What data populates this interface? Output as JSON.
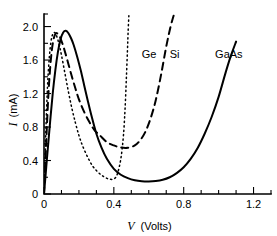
{
  "chart_data": {
    "type": "line",
    "title": "",
    "xlabel": "V  (Volts)",
    "ylabel": "I  (mA)",
    "xlabel_symbol": "V",
    "xlabel_unit": "(Volts)",
    "ylabel_symbol": "I",
    "ylabel_unit": "(mA)",
    "xlim": [
      0,
      1.3
    ],
    "ylim": [
      0,
      2.15
    ],
    "xticks": [
      0,
      0.4,
      0.8,
      1.2
    ],
    "xticklabels": [
      "0",
      "0.4",
      "0.8",
      "1.2"
    ],
    "xminorticks": [
      0.1,
      0.2,
      0.3,
      0.5,
      0.6,
      0.7,
      0.9,
      1.0,
      1.1,
      1.3
    ],
    "yticks": [
      0,
      0.4,
      0.8,
      1.2,
      1.6,
      2.0
    ],
    "yticklabels": [
      "0",
      "0.4",
      "0.8",
      "1.2",
      "1.6",
      "2.0"
    ],
    "grid": false,
    "legend_position": "inline-annotations",
    "series": [
      {
        "name": "Ge",
        "linestyle": "dotted",
        "color": "#000000",
        "label_x": 0.56,
        "label_y": 1.62,
        "x": [
          0.0,
          0.005,
          0.01,
          0.02,
          0.03,
          0.04,
          0.05,
          0.06,
          0.07,
          0.085,
          0.1,
          0.12,
          0.14,
          0.16,
          0.18,
          0.2,
          0.22,
          0.25,
          0.28,
          0.31,
          0.34,
          0.37,
          0.4,
          0.42,
          0.44,
          0.455,
          0.465,
          0.472,
          0.478,
          0.482,
          0.486
        ],
        "y": [
          0.0,
          0.35,
          0.72,
          1.28,
          1.62,
          1.82,
          1.91,
          1.93,
          1.9,
          1.8,
          1.66,
          1.44,
          1.22,
          1.02,
          0.85,
          0.7,
          0.58,
          0.44,
          0.33,
          0.26,
          0.21,
          0.18,
          0.18,
          0.24,
          0.42,
          0.7,
          1.05,
          1.4,
          1.72,
          1.95,
          2.13
        ]
      },
      {
        "name": "Si",
        "linestyle": "dashed",
        "color": "#000000",
        "label_x": 0.72,
        "label_y": 1.62,
        "x": [
          0.0,
          0.008,
          0.016,
          0.025,
          0.035,
          0.045,
          0.055,
          0.065,
          0.075,
          0.09,
          0.105,
          0.12,
          0.14,
          0.16,
          0.18,
          0.2,
          0.23,
          0.26,
          0.29,
          0.32,
          0.36,
          0.4,
          0.44,
          0.48,
          0.52,
          0.55,
          0.58,
          0.61,
          0.64,
          0.67,
          0.7,
          0.725,
          0.745
        ],
        "y": [
          0.0,
          0.4,
          0.78,
          1.18,
          1.5,
          1.72,
          1.85,
          1.91,
          1.92,
          1.88,
          1.8,
          1.7,
          1.55,
          1.4,
          1.26,
          1.13,
          0.98,
          0.86,
          0.76,
          0.7,
          0.62,
          0.58,
          0.555,
          0.552,
          0.58,
          0.64,
          0.74,
          0.9,
          1.12,
          1.42,
          1.76,
          2.0,
          2.15
        ]
      },
      {
        "name": "GaAs",
        "linestyle": "solid",
        "color": "#000000",
        "label_x": 0.98,
        "label_y": 1.62,
        "x": [
          0.0,
          0.01,
          0.02,
          0.035,
          0.05,
          0.065,
          0.08,
          0.095,
          0.11,
          0.125,
          0.14,
          0.155,
          0.17,
          0.19,
          0.21,
          0.23,
          0.25,
          0.27,
          0.3,
          0.33,
          0.36,
          0.4,
          0.44,
          0.48,
          0.52,
          0.56,
          0.6,
          0.64,
          0.68,
          0.72,
          0.76,
          0.8,
          0.84,
          0.88,
          0.92,
          0.96,
          1.0,
          1.04,
          1.07,
          1.1
        ],
        "y": [
          0.0,
          0.25,
          0.5,
          0.86,
          1.2,
          1.48,
          1.7,
          1.85,
          1.93,
          1.95,
          1.92,
          1.86,
          1.78,
          1.64,
          1.48,
          1.3,
          1.12,
          0.95,
          0.72,
          0.55,
          0.42,
          0.3,
          0.23,
          0.19,
          0.165,
          0.153,
          0.15,
          0.155,
          0.17,
          0.2,
          0.25,
          0.32,
          0.42,
          0.55,
          0.72,
          0.92,
          1.16,
          1.45,
          1.65,
          1.82
        ]
      }
    ]
  }
}
